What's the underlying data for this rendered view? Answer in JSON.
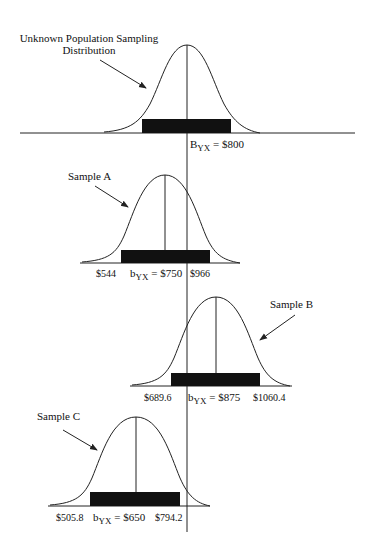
{
  "diagram": {
    "population": {
      "label_line1": "Unknown Population Sampling",
      "label_line2": "Distribution",
      "param_symbol": "B",
      "param_sub": "YX",
      "param_value": " = $800"
    },
    "samples": [
      {
        "name": "Sample A",
        "lower": "$544",
        "coef_symbol": "b",
        "coef_sub": "YX",
        "coef_value": " = $750",
        "upper": "$966"
      },
      {
        "name": "Sample B",
        "lower": "$689.6",
        "coef_symbol": "b",
        "coef_sub": "YX",
        "coef_value": " = $875",
        "upper": "$1060.4"
      },
      {
        "name": "Sample C",
        "lower": "$505.8",
        "coef_symbol": "b",
        "coef_sub": "YX",
        "coef_value": " = $650",
        "upper": "$794.2"
      }
    ],
    "colors": {
      "line": "#222222",
      "bar": "#111111"
    }
  }
}
